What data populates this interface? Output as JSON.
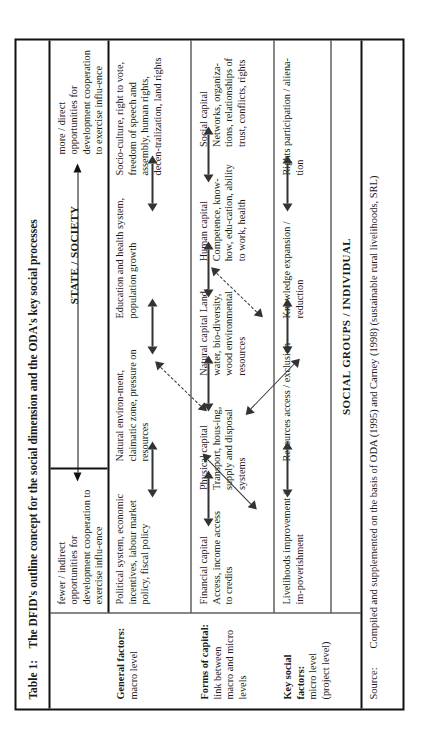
{
  "table": {
    "label": "Table 1:",
    "title": "The DFID's outline concept for the social dimension and the ODA's key social processes",
    "source_label": "Source:",
    "source_text": "Compiled and supplemented on the basis of ODA (1995) and Carney (1998) (sustainable rural livelihoods, SRL)"
  },
  "headers": {
    "top": "STATE / SOCIETY",
    "bottom": "SOCIAL GROUPS / INDIVIDUAL"
  },
  "opportunities": {
    "left": "fewer / indirect opportunities for development cooperation to exercise influ-ence",
    "right": "more / direct opportunities for development cooperation to exercise influ-ence",
    "arrow": "double-headed-arrow"
  },
  "row_labels": [
    {
      "title": "General factors:",
      "sub": "macro level"
    },
    {
      "title": "Forms of capital:",
      "sub": "link between macro and micro levels"
    },
    {
      "title": "Key social factors:",
      "sub": "micro level (project level)"
    }
  ],
  "rows": [
    {
      "name": "general-factors",
      "cells": [
        {
          "bold": "",
          "text": "Political system, economic incentives, labour market policy, fiscal policy"
        },
        {
          "bold": "",
          "text": "Natural environ-ment, claimatic zone, pressure on resources"
        },
        {
          "bold": "",
          "text": "Education and health system, population growth"
        },
        {
          "bold": "",
          "text": "Socio-culture, right to vote, freedom of speech and assembly, human rights, decen-tralization, land rights"
        }
      ]
    },
    {
      "name": "forms-of-capital",
      "cells": [
        {
          "bold": "Financial capital",
          "text": "Access, income access to credits"
        },
        {
          "bold": "Physical capital",
          "text": "Transport, hous-ing, supply and disposal systems"
        },
        {
          "bold": "Natural capital",
          "text": "Land, water, bio-diversity, wood environmental resources"
        },
        {
          "bold": "Human capital",
          "text": "Competence, know-how, edu-cation, ability to work, health"
        },
        {
          "bold": "Social capital",
          "text": "Networks, organiza-tions, relationships of trust, conflicts, rights"
        }
      ]
    },
    {
      "name": "key-social-factors",
      "cells": [
        {
          "bold": "Livelihoods",
          "text": "improvement / im-poverishment"
        },
        {
          "bold": "Resources",
          "text": "access / exclusion"
        },
        {
          "bold": "Knowledge",
          "text": "expansion / reduction"
        },
        {
          "bold": "Rights",
          "text": "participation / aliena-tion"
        }
      ]
    }
  ],
  "connectors": {
    "solid_double_arrow": "double-headed-arrow",
    "dashed_double_arrow": "dashed-double-headed-arrow"
  },
  "colors": {
    "border": "#111111",
    "text": "#1a1a1a",
    "arrow": "#333333",
    "background": "#ffffff"
  }
}
